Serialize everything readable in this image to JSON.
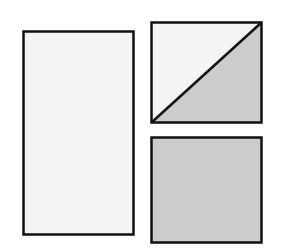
{
  "diagram": {
    "colors": {
      "background": "#ffffff",
      "light_fill": "#f4f4f4",
      "shaded_fill": "#cccccc",
      "stroke": "#111111"
    },
    "shapes": [
      {
        "id": "tall-rectangle",
        "x": 23,
        "y": 31,
        "width": 111,
        "height": 204,
        "fill": "light"
      },
      {
        "id": "split-square",
        "x": 151,
        "y": 22,
        "width": 110,
        "height": 101,
        "fill": "diagonal: upper-left light, lower-right shaded"
      },
      {
        "id": "shaded-square",
        "x": 151,
        "y": 137,
        "width": 110,
        "height": 106,
        "fill": "shaded"
      }
    ]
  }
}
